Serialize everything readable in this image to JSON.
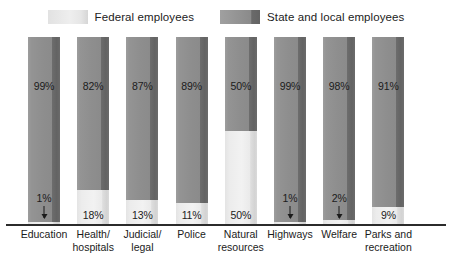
{
  "legend": {
    "entries": [
      {
        "label": "Federal employees",
        "color": "#eeeeee",
        "key": "federal"
      },
      {
        "label": "State and local employees",
        "color": "#8b8b8b",
        "key": "state"
      }
    ]
  },
  "chart_data": {
    "type": "bar",
    "stacked": true,
    "title": "",
    "subtitle": "",
    "xlabel": "",
    "ylabel": "",
    "ylim": [
      0,
      100
    ],
    "grid": false,
    "legend_position": "top-center",
    "categories": [
      "Education",
      "Health/ hospitals",
      "Judicial/ legal",
      "Police",
      "Natural resources",
      "Highways",
      "Welfare",
      "Parks and recreation"
    ],
    "category_lines": [
      [
        "Education"
      ],
      [
        "Health/",
        "hospitals"
      ],
      [
        "Judicial/",
        "legal"
      ],
      [
        "Police"
      ],
      [
        "Natural",
        "resources"
      ],
      [
        "Highways"
      ],
      [
        "Welfare"
      ],
      [
        "Parks and",
        "recreation"
      ]
    ],
    "series": [
      {
        "name": "State and local employees",
        "color": "#8b8b8b",
        "values": [
          99,
          82,
          87,
          89,
          50,
          99,
          98,
          91
        ],
        "labels": [
          "99%",
          "82%",
          "87%",
          "89%",
          "50%",
          "99%",
          "98%",
          "91%"
        ]
      },
      {
        "name": "Federal employees",
        "color": "#eeeeee",
        "values": [
          1,
          18,
          13,
          11,
          50,
          1,
          2,
          9
        ],
        "labels": [
          "1%",
          "18%",
          "13%",
          "11%",
          "50%",
          "1%",
          "2%",
          "9%"
        ],
        "callout": [
          true,
          false,
          false,
          false,
          false,
          true,
          true,
          false
        ]
      }
    ]
  }
}
